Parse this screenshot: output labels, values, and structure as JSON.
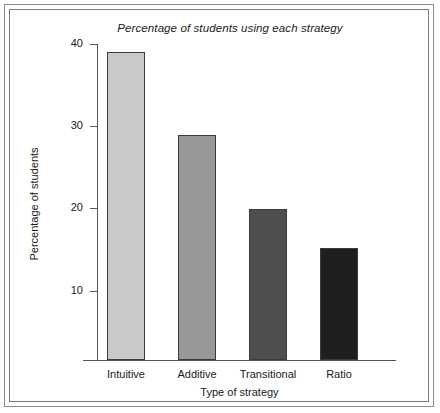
{
  "figure": {
    "background_color": "#ffffff",
    "frame_color": "#8e8e8e"
  },
  "chart_data": {
    "type": "bar",
    "title": "Percentage of students using each strategy",
    "xlabel": "Type of strategy",
    "ylabel": "Percentage of students",
    "categories": [
      "Intuitive",
      "Additive",
      "Transitional",
      "Ratio"
    ],
    "values": [
      39,
      29,
      20,
      15.2
    ],
    "series": [
      {
        "name": "Percentage of students",
        "values": [
          39,
          29,
          20,
          15.2
        ]
      }
    ],
    "bar_colors": [
      "#c9c9c9",
      "#989898",
      "#4f4f4f",
      "#1f1f1f"
    ],
    "bar_edge_color": "#3c3c3c",
    "ylim": [
      0,
      41
    ],
    "yticks": [
      10,
      20,
      30,
      40
    ],
    "ytick_labels": [
      "10",
      "20",
      "30",
      "40"
    ],
    "grid": false,
    "legend": false,
    "legend_position": "none",
    "axis_color": "#555555"
  }
}
